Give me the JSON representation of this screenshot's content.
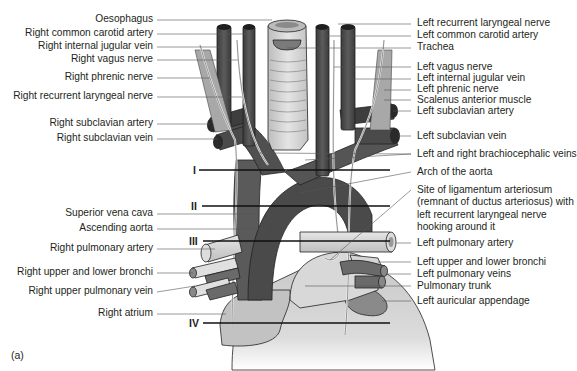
{
  "figure": {
    "caption": "(a)",
    "colors": {
      "vessel_dark": "#4a4a4a",
      "vessel_mid": "#6b6b6b",
      "trachea": "#d2d2d2",
      "heart": "#cfcfcf",
      "nerve": "#e6e6e6",
      "muscle": "#9a9a9a",
      "text": "#231f20",
      "leader": "#555555"
    }
  },
  "labels_left": [
    {
      "text": "Oesophagus",
      "y": 19
    },
    {
      "text": "Right common carotid artery",
      "y": 33
    },
    {
      "text": "Right internal jugular vein",
      "y": 46
    },
    {
      "text": "Right vagus nerve",
      "y": 59
    },
    {
      "text": "Right phrenic nerve",
      "y": 77
    },
    {
      "text": "Right recurrent laryngeal nerve",
      "y": 96
    },
    {
      "text": "Right subclavian artery",
      "y": 123
    },
    {
      "text": "Right subclavian vein",
      "y": 138
    },
    {
      "text": "Superior vena cava",
      "y": 213
    },
    {
      "text": "Ascending aorta",
      "y": 228
    },
    {
      "text": "Right pulmonary artery",
      "y": 248
    },
    {
      "text": "Right upper and lower bronchi",
      "y": 272
    },
    {
      "text": "Right upper pulmonary vein",
      "y": 291
    },
    {
      "text": "Right atrium",
      "y": 313
    }
  ],
  "labels_right": [
    {
      "text": "Left recurrent laryngeal nerve",
      "y": 23
    },
    {
      "text": "Left common carotid artery",
      "y": 35
    },
    {
      "text": "Trachea",
      "y": 47
    },
    {
      "text": "Left vagus nerve",
      "y": 66
    },
    {
      "text": "Left internal jugular vein",
      "y": 78
    },
    {
      "text": "Left phrenic nerve",
      "y": 89
    },
    {
      "text": "Scalenus anterior muscle",
      "y": 99
    },
    {
      "text": "Left subclavian artery",
      "y": 110
    },
    {
      "text": "Left subclavian vein",
      "y": 135
    },
    {
      "text": "Left and right brachiocephalic veins",
      "y": 153
    },
    {
      "text": "Arch of the aorta",
      "y": 171
    },
    {
      "text": "Site of ligamentum arteriosum (remnant of ductus arteriosus) with left recurrent laryngeal nerve hooking around it",
      "y": 189
    },
    {
      "text": "Left pulmonary artery",
      "y": 242
    },
    {
      "text": "Left upper and lower bronchi",
      "y": 261
    },
    {
      "text": "Left pulmonary veins",
      "y": 273
    },
    {
      "text": "Pulmonary trunk",
      "y": 285
    },
    {
      "text": "Left auricular appendage",
      "y": 300
    }
  ],
  "levels": [
    {
      "numeral": "I",
      "y": 170
    },
    {
      "numeral": "II",
      "y": 206
    },
    {
      "numeral": "III",
      "y": 241
    },
    {
      "numeral": "IV",
      "y": 323
    }
  ]
}
